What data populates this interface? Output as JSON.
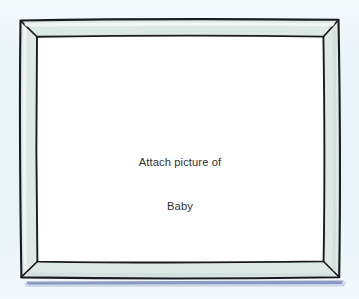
{
  "page": {
    "title": "Attach picture of Baby",
    "background_color": "#e9f4f9"
  },
  "frame": {
    "name": "picture-frame",
    "style": "hand-drawn mitred photo frame",
    "band_fill_color": "#dde9e5",
    "band_highlight_color": "#eef5f2",
    "outline_color": "#1b1b1f",
    "mat_color": "#ffffff",
    "shadow_color": "#3b4b8c",
    "outer": {
      "left": 19,
      "top": 19,
      "right": 340,
      "bottom": 278
    },
    "inner": {
      "left": 36,
      "top": 36,
      "right": 324,
      "bottom": 262
    }
  },
  "placeholder": {
    "line1": "Attach picture of",
    "line2": "Baby",
    "text_color": "#2f2f33"
  }
}
